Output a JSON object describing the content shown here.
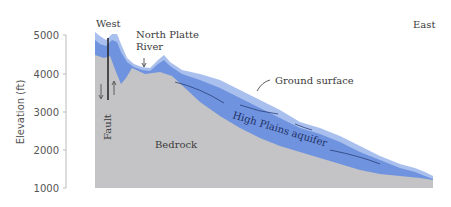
{
  "diagram": {
    "type": "geologic cross-section",
    "y_axis": {
      "label": "Elevation (ft)",
      "ticks": [
        "5000",
        "4000",
        "3000",
        "2000",
        "1000"
      ]
    },
    "labels": {
      "west": "West",
      "east": "East",
      "river_line1": "North Platte",
      "river_line2": "River",
      "ground_surface": "Ground surface",
      "aquifer": "High Plains aquifer",
      "bedrock": "Bedrock",
      "fault": "Fault"
    },
    "colors": {
      "bedrock": "#c4c4c6",
      "aquifer": "#6f93de",
      "surface_layer": "#a9c0ee",
      "fault_line": "#222222",
      "axis": "#aaaaaa"
    }
  }
}
